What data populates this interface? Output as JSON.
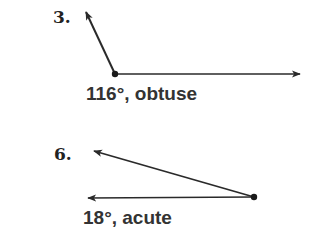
{
  "problems": [
    {
      "number": "3.",
      "label": "116°, obtuse",
      "measure_degrees": 116,
      "classification": "obtuse",
      "vertex": [
        115,
        74
      ],
      "ray_ends": [
        [
          86,
          12
        ],
        [
          300,
          74
        ]
      ]
    },
    {
      "number": "6.",
      "label": "18°, acute",
      "measure_degrees": 18,
      "classification": "acute",
      "vertex": [
        254,
        197
      ],
      "ray_ends": [
        [
          94,
          151
        ],
        [
          88,
          198
        ]
      ]
    }
  ],
  "colors": {
    "stroke": "#2a2a2a",
    "text": "#333333",
    "background": "#ffffff"
  }
}
